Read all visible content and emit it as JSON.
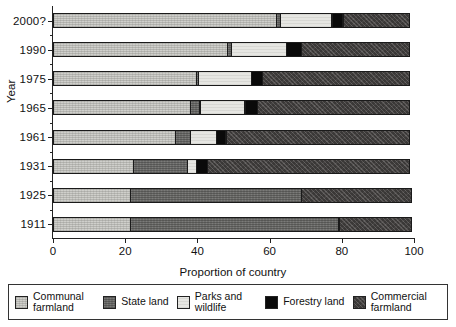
{
  "chart_data": {
    "type": "bar",
    "orientation": "horizontal",
    "stacked": true,
    "title": "",
    "xlabel": "Proportion of country",
    "ylabel": "Year",
    "xlim": [
      0,
      100
    ],
    "xticks": [
      0,
      20,
      40,
      60,
      80,
      100
    ],
    "grid": false,
    "legend_position": "bottom",
    "categories": [
      "2000?",
      "1990",
      "1975",
      "1965",
      "1961",
      "1931",
      "1925",
      "1911"
    ],
    "series": [
      {
        "name": "Communal farmland",
        "key": "communal",
        "color": "#cfcfcb",
        "values": [
          62.0,
          48.5,
          39.8,
          38.1,
          34.0,
          22.5,
          21.5,
          21.5
        ]
      },
      {
        "name": "State land",
        "key": "state",
        "color": "#6e6e6c",
        "values": [
          1.5,
          1.2,
          0.8,
          3.0,
          4.5,
          15.1,
          47.8,
          58.1
        ]
      },
      {
        "name": "Parks and wildlife",
        "key": "parks",
        "color": "#e6e6e2",
        "values": [
          14.4,
          15.5,
          14.9,
          12.7,
          7.5,
          2.8,
          0.0,
          0.0
        ]
      },
      {
        "name": "Forestry land",
        "key": "forestry",
        "color": "#0a0a0a",
        "values": [
          3.3,
          4.4,
          3.3,
          3.6,
          2.8,
          3.2,
          0.0,
          0.0
        ]
      },
      {
        "name": "Commercial farmland",
        "key": "commercial",
        "color": "#474443",
        "values": [
          18.8,
          30.4,
          41.2,
          42.6,
          51.2,
          56.4,
          30.7,
          20.4
        ]
      }
    ],
    "bars": [
      {
        "year": "2000?",
        "segments": [
          62.0,
          1.5,
          14.4,
          3.3,
          18.8
        ]
      },
      {
        "year": "1990",
        "segments": [
          48.5,
          1.2,
          15.5,
          4.4,
          30.4
        ]
      },
      {
        "year": "1975",
        "segments": [
          39.8,
          0.8,
          14.9,
          3.3,
          41.2
        ]
      },
      {
        "year": "1965",
        "segments": [
          38.1,
          3.0,
          12.7,
          3.6,
          42.6
        ]
      },
      {
        "year": "1961",
        "segments": [
          34.0,
          4.5,
          7.5,
          2.8,
          51.2
        ]
      },
      {
        "year": "1931",
        "segments": [
          22.5,
          15.1,
          2.8,
          3.2,
          56.4
        ]
      },
      {
        "year": "1925",
        "segments": [
          21.5,
          47.8,
          0.0,
          0.0,
          30.7
        ]
      },
      {
        "year": "1911",
        "segments": [
          21.5,
          58.1,
          0.0,
          0.0,
          20.4
        ]
      }
    ]
  },
  "axes": {
    "y_title": "Year",
    "x_title": "Proportion of country",
    "y_tick_labels": [
      "2000?",
      "1990",
      "1975",
      "1965",
      "1961",
      "1931",
      "1925",
      "1911"
    ],
    "x_tick_labels": [
      "0",
      "20",
      "40",
      "60",
      "80",
      "100"
    ]
  },
  "legend": {
    "items": [
      {
        "label": "Communal farmland",
        "swatch": "communal-swatch"
      },
      {
        "label": "State land",
        "swatch": "state-swatch"
      },
      {
        "label": "Parks and wildlife",
        "swatch": "parks-swatch"
      },
      {
        "label": "Forestry land",
        "swatch": "forestry-swatch"
      },
      {
        "label": "Commercial farmland",
        "swatch": "commercial-swatch"
      }
    ]
  }
}
